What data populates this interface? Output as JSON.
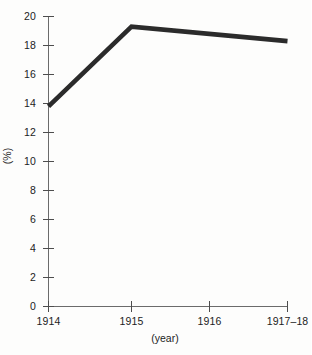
{
  "chart_data": {
    "type": "line",
    "title": "",
    "subtitle": "",
    "xlabel": "(year)",
    "ylabel": "(%)",
    "categories": [
      "1914",
      "1915",
      "1916",
      "1917–18"
    ],
    "x_tick_labels": [
      "1914",
      "1915",
      "1916",
      "1917–18"
    ],
    "y_tick_labels": [
      "0",
      "2",
      "4",
      "6",
      "8",
      "10",
      "12",
      "14",
      "16",
      "18",
      "20"
    ],
    "y_ticks": [
      0,
      2,
      4,
      6,
      8,
      10,
      12,
      14,
      16,
      18,
      20
    ],
    "ylim": [
      0,
      20
    ],
    "xlim_categories": 4,
    "grid": false,
    "legend": null,
    "legend_position": "none",
    "series": [
      {
        "name": "",
        "color": "#2b2b2b",
        "line_width_px": 4.6,
        "values": [
          13.8,
          19.3,
          18.8,
          18.3
        ]
      }
    ],
    "annotations": []
  },
  "axes": {
    "y_axis_title": "(%)",
    "x_axis_title": "(year)"
  },
  "style": {
    "background": "#fdfdfc",
    "axis_color": "#6b6b6b",
    "tick_color": "#4d4d4d",
    "text_color": "#1c1c1c",
    "series_color": "#2b2b2b"
  }
}
